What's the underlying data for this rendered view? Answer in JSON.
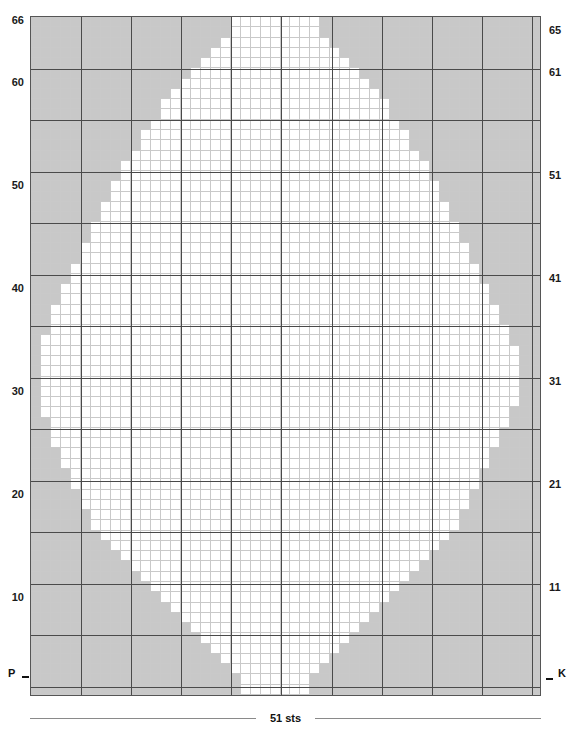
{
  "chart_data": {
    "type": "heatmap",
    "width_stitches": 51,
    "height_rows": 66,
    "legend": [
      {
        "symbol": "P",
        "label": "P",
        "color": "#c8c8c8",
        "meaning": "purl"
      },
      {
        "symbol": "K",
        "label": "K",
        "color": "#ffffff",
        "meaning": "knit"
      }
    ],
    "xlabel": "51 sts",
    "ylabel": "",
    "grid": true,
    "major_gridline_interval": 5,
    "left_row_labels": [
      "66",
      "60",
      "50",
      "40",
      "30",
      "20",
      "10"
    ],
    "left_row_label_rows": [
      66,
      60,
      50,
      40,
      30,
      20,
      10
    ],
    "right_row_labels": [
      "65",
      "61",
      "51",
      "41",
      "31",
      "21",
      "11"
    ],
    "right_row_label_rows": [
      65,
      61,
      51,
      41,
      31,
      21,
      11
    ],
    "cell_colors": {
      "purl": "#c8c8c8",
      "knit": "#ffffff"
    },
    "row_purl_runs": [
      {
        "row": 66,
        "left": 20,
        "right": 22
      },
      {
        "row": 65,
        "left": 20,
        "right": 22
      },
      {
        "row": 64,
        "left": 19,
        "right": 21
      },
      {
        "row": 63,
        "left": 18,
        "right": 20
      },
      {
        "row": 62,
        "left": 17,
        "right": 19
      },
      {
        "row": 61,
        "left": 16,
        "right": 18
      },
      {
        "row": 60,
        "left": 15,
        "right": 17
      },
      {
        "row": 59,
        "left": 14,
        "right": 16
      },
      {
        "row": 58,
        "left": 13,
        "right": 15
      },
      {
        "row": 57,
        "left": 13,
        "right": 15
      },
      {
        "row": 56,
        "left": 12,
        "right": 14
      },
      {
        "row": 55,
        "left": 11,
        "right": 13
      },
      {
        "row": 54,
        "left": 11,
        "right": 13
      },
      {
        "row": 53,
        "left": 10,
        "right": 12
      },
      {
        "row": 52,
        "left": 9,
        "right": 11
      },
      {
        "row": 51,
        "left": 9,
        "right": 11
      },
      {
        "row": 50,
        "left": 8,
        "right": 10
      },
      {
        "row": 49,
        "left": 8,
        "right": 10
      },
      {
        "row": 48,
        "left": 7,
        "right": 9
      },
      {
        "row": 47,
        "left": 7,
        "right": 9
      },
      {
        "row": 46,
        "left": 6,
        "right": 8
      },
      {
        "row": 45,
        "left": 6,
        "right": 8
      },
      {
        "row": 44,
        "left": 5,
        "right": 7
      },
      {
        "row": 43,
        "left": 5,
        "right": 7
      },
      {
        "row": 42,
        "left": 4,
        "right": 6
      },
      {
        "row": 41,
        "left": 4,
        "right": 6
      },
      {
        "row": 40,
        "left": 3,
        "right": 5
      },
      {
        "row": 39,
        "left": 3,
        "right": 5
      },
      {
        "row": 38,
        "left": 2,
        "right": 4
      },
      {
        "row": 37,
        "left": 2,
        "right": 4
      },
      {
        "row": 36,
        "left": 2,
        "right": 3
      },
      {
        "row": 35,
        "left": 1,
        "right": 3
      },
      {
        "row": 34,
        "left": 1,
        "right": 2
      },
      {
        "row": 33,
        "left": 1,
        "right": 2
      },
      {
        "row": 32,
        "left": 1,
        "right": 2
      },
      {
        "row": 31,
        "left": 1,
        "right": 2
      },
      {
        "row": 30,
        "left": 1,
        "right": 2
      },
      {
        "row": 29,
        "left": 1,
        "right": 2
      },
      {
        "row": 28,
        "left": 1,
        "right": 3
      },
      {
        "row": 27,
        "left": 2,
        "right": 3
      },
      {
        "row": 26,
        "left": 2,
        "right": 4
      },
      {
        "row": 25,
        "left": 2,
        "right": 4
      },
      {
        "row": 24,
        "left": 3,
        "right": 5
      },
      {
        "row": 23,
        "left": 3,
        "right": 5
      },
      {
        "row": 22,
        "left": 4,
        "right": 6
      },
      {
        "row": 21,
        "left": 4,
        "right": 6
      },
      {
        "row": 20,
        "left": 5,
        "right": 7
      },
      {
        "row": 19,
        "left": 5,
        "right": 7
      },
      {
        "row": 18,
        "left": 6,
        "right": 8
      },
      {
        "row": 17,
        "left": 6,
        "right": 8
      },
      {
        "row": 16,
        "left": 7,
        "right": 9
      },
      {
        "row": 15,
        "left": 8,
        "right": 10
      },
      {
        "row": 14,
        "left": 9,
        "right": 11
      },
      {
        "row": 13,
        "left": 10,
        "right": 12
      },
      {
        "row": 12,
        "left": 11,
        "right": 13
      },
      {
        "row": 11,
        "left": 12,
        "right": 14
      },
      {
        "row": 10,
        "left": 13,
        "right": 15
      },
      {
        "row": 9,
        "left": 14,
        "right": 16
      },
      {
        "row": 8,
        "left": 15,
        "right": 17
      },
      {
        "row": 7,
        "left": 16,
        "right": 18
      },
      {
        "row": 6,
        "left": 17,
        "right": 19
      },
      {
        "row": 5,
        "left": 18,
        "right": 20
      },
      {
        "row": 4,
        "left": 19,
        "right": 21
      },
      {
        "row": 3,
        "left": 20,
        "right": 22
      },
      {
        "row": 2,
        "left": 21,
        "right": 23
      },
      {
        "row": 1,
        "left": 21,
        "right": 23
      }
    ]
  },
  "chart": {
    "p_marker": "P",
    "k_marker": "K",
    "sts_label": "51 sts"
  }
}
